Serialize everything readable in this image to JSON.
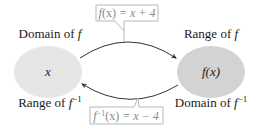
{
  "diagram": {
    "title": "",
    "left_set": {
      "top_label_prefix": "Domain of ",
      "top_label_func": "f",
      "bottom_label_prefix": "Range of ",
      "bottom_label_func": "f",
      "bottom_label_sup": "−1",
      "element": "x",
      "fill": "#e6e6e6"
    },
    "right_set": {
      "top_label_prefix": "Range of ",
      "top_label_func": "f",
      "bottom_label_prefix": "Domain of ",
      "bottom_label_func": "f",
      "bottom_label_sup": "−1",
      "element": "f(x)",
      "fill": "#d3d3d3"
    },
    "forward_mapping": {
      "lhs_func": "f",
      "lhs_arg": "(x)",
      "rhs": " = x + 4",
      "direction": "left-to-right"
    },
    "inverse_mapping": {
      "lhs_func": "f",
      "lhs_sup": "−1",
      "lhs_arg": "(x)",
      "rhs": " = x − 4",
      "direction": "right-to-left"
    },
    "colors": {
      "arrow": "#333333",
      "callout_border": "#b8b8b8",
      "callout_text": "#8a8a8a",
      "text": "#1a1a1a"
    }
  }
}
